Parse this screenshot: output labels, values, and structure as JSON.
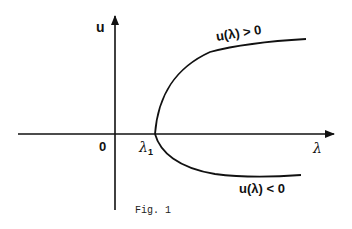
{
  "figure": {
    "caption": "Fig. 1",
    "axes": {
      "vertical_label": "u",
      "horizontal_label": "λ",
      "origin_label": "0"
    },
    "markers": {
      "bifurcation_point": "λ",
      "bifurcation_subscript": "1"
    },
    "branches": {
      "upper_label": "u(λ) > 0",
      "lower_label": "u(λ) < 0"
    },
    "colors": {
      "ink": "#111111",
      "background": "#ffffff"
    }
  }
}
